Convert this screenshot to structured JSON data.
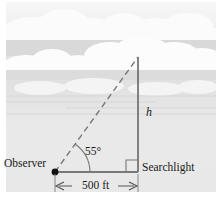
{
  "figure": {
    "background_color": "#e9e9e9",
    "line_color": "#555555",
    "text_color": "#1a1a1a"
  },
  "labels": {
    "observer": "Observer",
    "searchlight": "Searchlight",
    "angle": "55°",
    "height": "h",
    "base": "500 ft"
  },
  "diagram_data": {
    "type": "right-triangle",
    "angle_of_elevation_deg": 55,
    "base_length": "500 ft",
    "opposite_side_label": "h",
    "vertices": {
      "observer": [
        55,
        172
      ],
      "searchlight": [
        138,
        172
      ],
      "beam_top": [
        138,
        57
      ]
    },
    "hypotenuse_style": "dashed",
    "right_angle_marked": true,
    "scene": "clouds"
  }
}
